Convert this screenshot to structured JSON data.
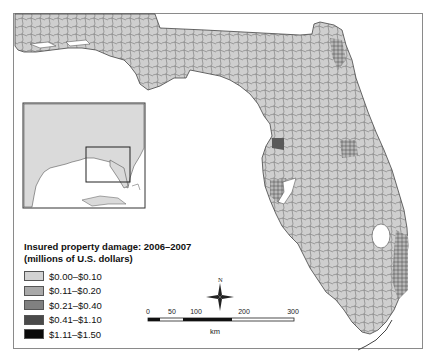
{
  "map": {
    "subject": "Florida",
    "frame": {
      "border_color": "#8a8a8a"
    },
    "colors": {
      "land_default": "#cfcfcf",
      "boundary": "#444444",
      "water": "#ffffff"
    }
  },
  "legend": {
    "title_line1": "Insured property damage: 2006–2007",
    "title_line2": "(millions of U.S. dollars)",
    "items": [
      {
        "label": "$0.00–$0.10",
        "color": "#d2d2d2"
      },
      {
        "label": "$0.11–$0.20",
        "color": "#a9a9a9"
      },
      {
        "label": "$0.21–$0.40",
        "color": "#808080"
      },
      {
        "label": "$0.41–$1.10",
        "color": "#4a4a4a"
      },
      {
        "label": "$1.11–$1.50",
        "color": "#0a0a0a"
      }
    ]
  },
  "scale_bar": {
    "ticks": [
      "0",
      "50",
      "100",
      "200",
      "300"
    ],
    "unit": "km"
  },
  "north_arrow": {
    "label": "N"
  },
  "inset": {
    "description": "Southeastern United States locator map with Florida highlighted by rectangle"
  }
}
